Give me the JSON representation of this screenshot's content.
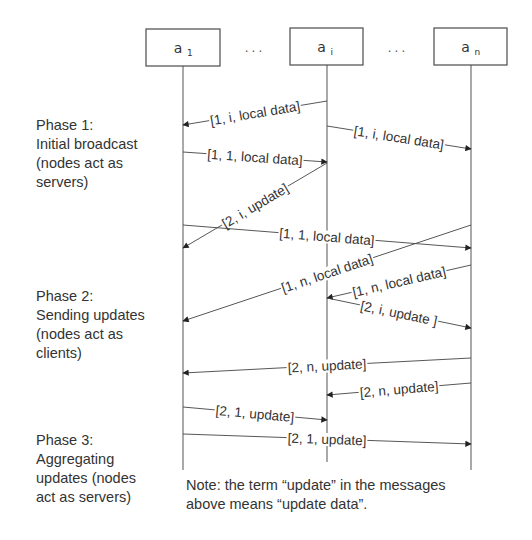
{
  "diagram": {
    "nodes": [
      {
        "id": "a1",
        "base": "a",
        "sub": "1",
        "x": 183,
        "box": [
          146,
          29,
          74,
          37
        ]
      },
      {
        "id": "ai",
        "base": "a",
        "sub": "i",
        "x": 327,
        "box": [
          290,
          28,
          73,
          37
        ]
      },
      {
        "id": "an",
        "base": "a",
        "sub": "n",
        "x": 471,
        "box": [
          434,
          28,
          73,
          37
        ]
      }
    ],
    "ellipses": [
      {
        "text": "...",
        "x": 255,
        "y": 52
      },
      {
        "text": "...",
        "x": 398,
        "y": 52
      }
    ],
    "lifelines": [
      {
        "node": "a1",
        "y1": 66,
        "y2": 470
      },
      {
        "node": "ai",
        "y1": 65,
        "y2": 462
      },
      {
        "node": "an",
        "y1": 65,
        "y2": 470
      }
    ],
    "messages": [
      {
        "label": "[1, i, local data]",
        "from": "ai",
        "to": "a1",
        "y1": 101,
        "y2": 125,
        "phase": 1
      },
      {
        "label": "[1, i, local data]",
        "from": "ai",
        "to": "an",
        "y1": 126,
        "y2": 149,
        "phase": 1
      },
      {
        "label": "[1, 1, local data]",
        "from": "a1",
        "to": "ai",
        "y1": 152,
        "y2": 162,
        "phase": 1
      },
      {
        "label": "[2, i, update]",
        "from": "ai",
        "to": "a1",
        "y1": 163,
        "y2": 248,
        "phase": 2
      },
      {
        "label": "[1, 1, local data]",
        "from": "a1",
        "to": "an",
        "y1": 225,
        "y2": 248,
        "phase": 1
      },
      {
        "label": "[1, n, local data]",
        "from": "an",
        "to": "a1",
        "y1": 225,
        "y2": 321,
        "phase": 1
      },
      {
        "label": "[1, n, local data]",
        "from": "an",
        "to": "ai",
        "y1": 265,
        "y2": 298,
        "phase": 1
      },
      {
        "label": "[2, i, update ]",
        "from": "ai",
        "to": "an",
        "y1": 298,
        "y2": 328,
        "phase": 2
      },
      {
        "label": "[2, n, update]",
        "from": "an",
        "to": "a1",
        "y1": 358,
        "y2": 373,
        "phase": 2
      },
      {
        "label": "[2, n, update]",
        "from": "an",
        "to": "ai",
        "y1": 383,
        "y2": 395,
        "phase": 2
      },
      {
        "label": "[2, 1, update]",
        "from": "a1",
        "to": "ai",
        "y1": 407,
        "y2": 420,
        "phase": 2
      },
      {
        "label": "[2, 1, update]",
        "from": "a1",
        "to": "an",
        "y1": 434,
        "y2": 444,
        "phase": 2
      }
    ]
  },
  "phases": [
    {
      "text": "Phase 1:\nInitial broadcast\n(nodes act as\nservers)",
      "top": 116
    },
    {
      "text": "Phase 2:\nSending updates\n(nodes act as\nclients)",
      "top": 287
    },
    {
      "text": "Phase 3:\nAggregating\nupdates (nodes\nact as servers)",
      "top": 431
    }
  ],
  "note": {
    "text": "Note: the term “update” in the messages\nabove means “update data”."
  },
  "colors": {
    "line": "#444444",
    "text": "#333333",
    "background": "#ffffff"
  }
}
